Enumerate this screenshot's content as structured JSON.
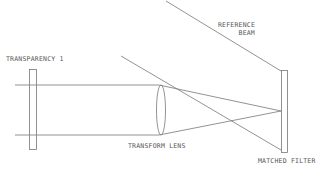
{
  "diagram": {
    "type": "optical-setup",
    "labels": {
      "transparency": "TRANSPARENCY 1",
      "reference_beam_line1": "REFERENCE",
      "reference_beam_line2": "BEAM",
      "lens": "TRANSFORM LENS",
      "filter": "MATCHED FILTER"
    },
    "components": [
      {
        "id": "transparency-1",
        "kind": "plate",
        "label": "TRANSPARENCY 1"
      },
      {
        "id": "transform-lens",
        "kind": "lens",
        "label": "TRANSFORM LENS"
      },
      {
        "id": "matched-filter",
        "kind": "plate",
        "label": "MATCHED FILTER"
      }
    ],
    "beams": [
      {
        "id": "input-beam-top",
        "from": "left",
        "to": "transform-lens"
      },
      {
        "id": "input-beam-bottom",
        "from": "left",
        "to": "transform-lens"
      },
      {
        "id": "reference-beam",
        "from": "upper-left",
        "to": "matched-filter"
      }
    ],
    "colors": {
      "line": "#777777",
      "text": "#555555",
      "background": "#ffffff"
    }
  }
}
